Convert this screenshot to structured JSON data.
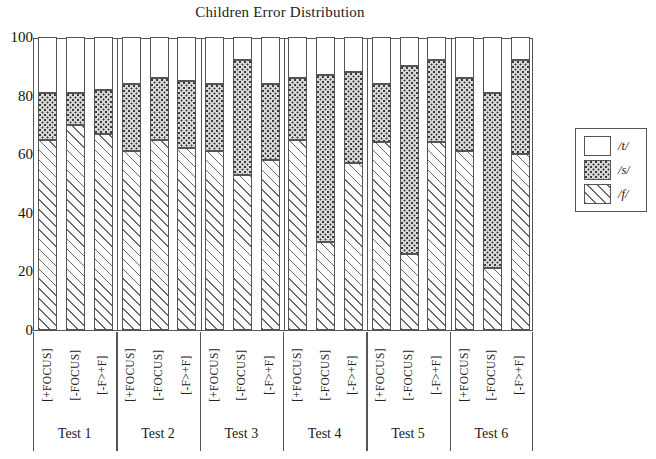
{
  "chart_data": {
    "type": "bar",
    "subtype": "stacked-bar",
    "title": "Children Error Distribution",
    "xlabel": "",
    "ylabel": "",
    "ylim": [
      0,
      100
    ],
    "yticks": [
      0,
      20,
      40,
      60,
      80,
      100
    ],
    "grid": false,
    "legend_position": "right",
    "groups": [
      "Test 1",
      "Test 2",
      "Test 3",
      "Test 4",
      "Test 5",
      "Test 6"
    ],
    "conditions": [
      "[+FOCUS]",
      "[-FOCUS]",
      "[-F>+F]"
    ],
    "categories": [
      "Test 1 [+FOCUS]",
      "Test 1 [-FOCUS]",
      "Test 1 [-F>+F]",
      "Test 2 [+FOCUS]",
      "Test 2 [-FOCUS]",
      "Test 2 [-F>+F]",
      "Test 3 [+FOCUS]",
      "Test 3 [-FOCUS]",
      "Test 3 [-F>+F]",
      "Test 4 [+FOCUS]",
      "Test 4 [-FOCUS]",
      "Test 4 [-F>+F]",
      "Test 5 [+FOCUS]",
      "Test 5 [-FOCUS]",
      "Test 5 [-F>+F]",
      "Test 6 [+FOCUS]",
      "Test 6 [-FOCUS]",
      "Test 6 [-F>+F]"
    ],
    "series": [
      {
        "name": "/f/",
        "pattern": "diagonal-hatch",
        "values": [
          65,
          70,
          67,
          61,
          65,
          62,
          61,
          53,
          58,
          65,
          30,
          57,
          64,
          26,
          64,
          61,
          21,
          60
        ]
      },
      {
        "name": "/s/",
        "pattern": "dotted",
        "values": [
          16,
          11,
          15,
          23,
          21,
          23,
          23,
          39,
          26,
          21,
          57,
          31,
          20,
          64,
          28,
          25,
          60,
          32
        ]
      },
      {
        "name": "/t/",
        "pattern": "white",
        "values": [
          19,
          19,
          18,
          16,
          14,
          15,
          16,
          8,
          16,
          14,
          13,
          12,
          16,
          10,
          8,
          14,
          19,
          8
        ]
      }
    ],
    "cumulative_tops": {
      "f": [
        65,
        70,
        67,
        61,
        65,
        62,
        61,
        53,
        58,
        65,
        30,
        57,
        64,
        26,
        64,
        61,
        21,
        60
      ],
      "fs": [
        81,
        81,
        82,
        84,
        86,
        85,
        84,
        92,
        84,
        86,
        87,
        88,
        84,
        90,
        92,
        86,
        81,
        92
      ],
      "fst": [
        100,
        100,
        100,
        100,
        100,
        100,
        100,
        100,
        100,
        100,
        100,
        100,
        100,
        100,
        100,
        100,
        100,
        100
      ]
    }
  },
  "legend": {
    "entries": [
      {
        "label": "/t/",
        "swatch": "white"
      },
      {
        "label": "/s/",
        "swatch": "dotted"
      },
      {
        "label": "/f/",
        "swatch": "diagonal-hatch"
      }
    ]
  },
  "axis": {
    "ytick_labels": [
      "100",
      "80",
      "60",
      "40",
      "20",
      "0"
    ]
  }
}
